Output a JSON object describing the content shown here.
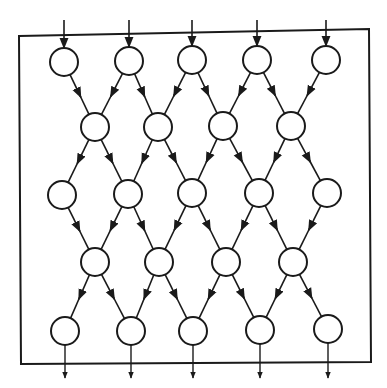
{
  "diagram": {
    "type": "systolic-array-lattice",
    "colors": {
      "stroke": "#1a1a1a",
      "background": "#ffffff"
    },
    "border": {
      "points": [
        [
          19,
          36
        ],
        [
          369,
          29
        ],
        [
          371,
          362
        ],
        [
          21,
          364
        ]
      ]
    },
    "node_radius": 14,
    "rows": [
      {
        "id": "row-1",
        "nodes": [
          [
            64,
            62
          ],
          [
            129,
            61
          ],
          [
            192,
            60
          ],
          [
            257,
            60
          ],
          [
            326,
            60
          ]
        ]
      },
      {
        "id": "row-2",
        "nodes": [
          [
            95,
            127
          ],
          [
            158,
            127
          ],
          [
            223,
            126
          ],
          [
            291,
            126
          ]
        ]
      },
      {
        "id": "row-3",
        "nodes": [
          [
            62,
            195
          ],
          [
            128,
            194
          ],
          [
            192,
            193
          ],
          [
            259,
            193
          ],
          [
            327,
            193
          ]
        ]
      },
      {
        "id": "row-4",
        "nodes": [
          [
            95,
            262
          ],
          [
            159,
            262
          ],
          [
            226,
            262
          ],
          [
            293,
            262
          ]
        ]
      },
      {
        "id": "row-5",
        "nodes": [
          [
            65,
            331
          ],
          [
            131,
            331
          ],
          [
            193,
            331
          ],
          [
            260,
            330
          ],
          [
            328,
            329
          ]
        ]
      }
    ],
    "inputs": {
      "count": 5,
      "start_y": 20,
      "label": ""
    },
    "outputs": {
      "count": 5,
      "end_y": 378,
      "label": ""
    }
  }
}
